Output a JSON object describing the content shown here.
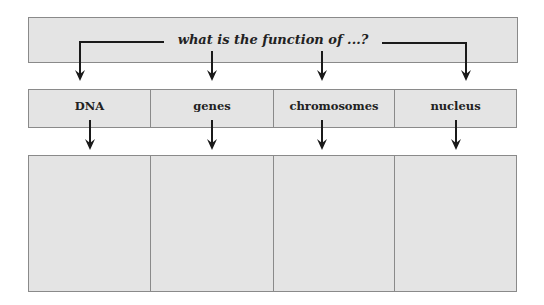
{
  "diagram": {
    "question": "what is the function of ...?",
    "categories": [
      {
        "label": "DNA",
        "answer": ""
      },
      {
        "label": "genes",
        "answer": ""
      },
      {
        "label": "chromosomes",
        "answer": ""
      },
      {
        "label": "nucleus",
        "answer": ""
      }
    ],
    "colors": {
      "box_fill": "#e4e4e4",
      "box_border": "#8a8a8a",
      "arrow": "#1a1a1a",
      "text": "#222222"
    }
  }
}
